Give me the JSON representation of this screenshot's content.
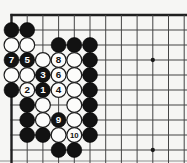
{
  "diagram": {
    "kind": "go-problem-diagram",
    "board_region": "top-left corner crop of a 19x19 go board",
    "columns_visible": 12,
    "rows_visible": 10,
    "move_sequence_shown": [
      "1",
      "2",
      "3",
      "4",
      "5",
      "6",
      "7",
      "8",
      "9",
      "10"
    ],
    "stones": [
      {
        "col": 1,
        "row": 2,
        "color": "black"
      },
      {
        "col": 2,
        "row": 2,
        "color": "black"
      },
      {
        "col": 1,
        "row": 3,
        "color": "white"
      },
      {
        "col": 2,
        "row": 3,
        "color": "white"
      },
      {
        "col": 4,
        "row": 3,
        "color": "black"
      },
      {
        "col": 5,
        "row": 3,
        "color": "black"
      },
      {
        "col": 6,
        "row": 3,
        "color": "black"
      },
      {
        "col": 1,
        "row": 4,
        "color": "black",
        "label": "7"
      },
      {
        "col": 2,
        "row": 4,
        "color": "black",
        "label": "5"
      },
      {
        "col": 3,
        "row": 4,
        "color": "white"
      },
      {
        "col": 4,
        "row": 4,
        "color": "white",
        "label": "8"
      },
      {
        "col": 5,
        "row": 4,
        "color": "white"
      },
      {
        "col": 6,
        "row": 4,
        "color": "black"
      },
      {
        "col": 1,
        "row": 5,
        "color": "white"
      },
      {
        "col": 2,
        "row": 5,
        "color": "white"
      },
      {
        "col": 3,
        "row": 5,
        "color": "black",
        "label": "3"
      },
      {
        "col": 4,
        "row": 5,
        "color": "white",
        "label": "6"
      },
      {
        "col": 5,
        "row": 5,
        "color": "white"
      },
      {
        "col": 6,
        "row": 5,
        "color": "black"
      },
      {
        "col": 1,
        "row": 6,
        "color": "black"
      },
      {
        "col": 2,
        "row": 6,
        "color": "white",
        "label": "2"
      },
      {
        "col": 3,
        "row": 6,
        "color": "black",
        "label": "1"
      },
      {
        "col": 4,
        "row": 6,
        "color": "white",
        "label": "4"
      },
      {
        "col": 5,
        "row": 6,
        "color": "white"
      },
      {
        "col": 6,
        "row": 6,
        "color": "black"
      },
      {
        "col": 2,
        "row": 7,
        "color": "black"
      },
      {
        "col": 3,
        "row": 7,
        "color": "white"
      },
      {
        "col": 5,
        "row": 7,
        "color": "white"
      },
      {
        "col": 6,
        "row": 7,
        "color": "black"
      },
      {
        "col": 2,
        "row": 8,
        "color": "black"
      },
      {
        "col": 3,
        "row": 8,
        "color": "white"
      },
      {
        "col": 4,
        "row": 8,
        "color": "black",
        "label": "9"
      },
      {
        "col": 5,
        "row": 8,
        "color": "white"
      },
      {
        "col": 6,
        "row": 8,
        "color": "black"
      },
      {
        "col": 2,
        "row": 9,
        "color": "black"
      },
      {
        "col": 3,
        "row": 9,
        "color": "black"
      },
      {
        "col": 4,
        "row": 9,
        "color": "white"
      },
      {
        "col": 5,
        "row": 9,
        "color": "white",
        "label": "10"
      },
      {
        "col": 6,
        "row": 9,
        "color": "black"
      },
      {
        "col": 4,
        "row": 10,
        "color": "black"
      },
      {
        "col": 5,
        "row": 10,
        "color": "black"
      }
    ],
    "star_points": [
      {
        "col": 10,
        "row": 4
      },
      {
        "col": 10,
        "row": 10
      }
    ],
    "colors": {
      "board_bg": "#f6f6f4",
      "grid_line": "#454545",
      "board_edge": "#1f1f1f",
      "black_stone": "#121212",
      "white_stone": "#fcfcfb",
      "white_stone_outline": "#1c1c1c",
      "star_point": "#1a1a1a",
      "bottom_artifact_line": "#9a9a9a",
      "black_stone_number": "#ffffff",
      "white_stone_number": "#111111"
    }
  }
}
